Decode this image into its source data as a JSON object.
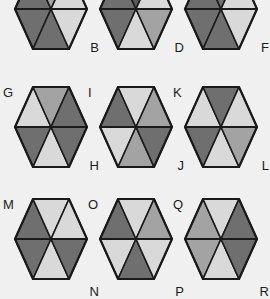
{
  "figure": {
    "background_color": "#f0f0f0",
    "stroke_color": "#1a1a1a",
    "palette": {
      "light": "#d9d9d9",
      "light2": "#cfcfcf",
      "medium": "#a3a3a3",
      "medium2": "#9a9a9a",
      "dark": "#6f6f6f",
      "darker": "#5a5a5a"
    },
    "grid": {
      "rows": 3,
      "cols": 3
    },
    "note": "Each hexagon is split by a horizontal midline; each half holds three triangles (up, down, up)."
  },
  "chart_data": {
    "type": "table",
    "xlabel": "",
    "ylabel": "",
    "categories": [
      "col-1",
      "col-2",
      "col-3"
    ],
    "legend": [
      "light",
      "medium",
      "dark",
      "darker"
    ],
    "cells": [
      {
        "row": 0,
        "col": 0,
        "label_top": "A",
        "label_bottom": "B",
        "clipped": "top",
        "top_half": [
          "dark",
          "medium",
          "light"
        ],
        "bottom_half": [
          "dark",
          "dark",
          "light"
        ]
      },
      {
        "row": 0,
        "col": 1,
        "label_top": "C",
        "label_bottom": "D",
        "clipped": "top",
        "top_half": [
          "dark",
          "darker",
          "light"
        ],
        "bottom_half": [
          "dark",
          "light",
          "medium"
        ]
      },
      {
        "row": 0,
        "col": 2,
        "label_top": "E",
        "label_bottom": "F",
        "clipped": "top",
        "top_half": [
          "dark",
          "dark",
          "light"
        ],
        "bottom_half": [
          "dark",
          "dark",
          "light"
        ]
      },
      {
        "row": 1,
        "col": 0,
        "label_top": "G",
        "label_bottom": "H",
        "clipped": "none",
        "top_half": [
          "light",
          "medium",
          "dark"
        ],
        "bottom_half": [
          "dark",
          "light",
          "dark"
        ]
      },
      {
        "row": 1,
        "col": 1,
        "label_top": "I",
        "label_bottom": "J",
        "clipped": "none",
        "top_half": [
          "dark",
          "light",
          "medium"
        ],
        "bottom_half": [
          "light",
          "medium",
          "dark"
        ]
      },
      {
        "row": 1,
        "col": 2,
        "label_top": "K",
        "label_bottom": "L",
        "clipped": "none",
        "top_half": [
          "light",
          "dark",
          "light"
        ],
        "bottom_half": [
          "dark",
          "light",
          "medium"
        ]
      },
      {
        "row": 2,
        "col": 0,
        "label_top": "M",
        "label_bottom": "N",
        "clipped": "bottom",
        "top_half": [
          "dark",
          "light",
          "light"
        ],
        "bottom_half": [
          "dark",
          "light",
          "dark"
        ]
      },
      {
        "row": 2,
        "col": 1,
        "label_top": "O",
        "label_bottom": "P",
        "clipped": "bottom",
        "top_half": [
          "dark",
          "light",
          "medium"
        ],
        "bottom_half": [
          "light",
          "dark",
          "light"
        ]
      },
      {
        "row": 2,
        "col": 2,
        "label_top": "Q",
        "label_bottom": "R",
        "clipped": "bottom",
        "top_half": [
          "medium",
          "light",
          "dark"
        ],
        "bottom_half": [
          "medium",
          "light",
          "dark"
        ]
      }
    ]
  }
}
